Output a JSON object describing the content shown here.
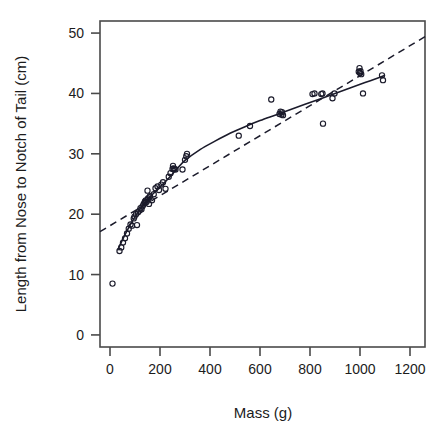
{
  "chart_data": {
    "type": "scatter",
    "title": "",
    "xlabel": "Mass (g)",
    "ylabel": "Length from Nose to Notch of Tail (cm)",
    "xlim": [
      -40,
      1260
    ],
    "ylim": [
      -2,
      52
    ],
    "xticks": [
      0,
      200,
      400,
      600,
      800,
      1000,
      1200
    ],
    "yticks": [
      0,
      10,
      20,
      30,
      40,
      50
    ],
    "xtick_labels": [
      "0",
      "200",
      "400",
      "600",
      "800",
      "1000",
      "1200"
    ],
    "ytick_labels": [
      "0",
      "10",
      "20",
      "30",
      "40",
      "50"
    ],
    "grid": false,
    "legend": "none",
    "marker": "open-circle",
    "point_color": "#1b1b2b",
    "series": [
      {
        "name": "Observations",
        "points": [
          [
            10,
            8.5
          ],
          [
            38,
            13.9
          ],
          [
            45,
            14.5
          ],
          [
            52,
            15.3
          ],
          [
            60,
            16.0
          ],
          [
            68,
            16.8
          ],
          [
            75,
            17.6
          ],
          [
            82,
            18.3
          ],
          [
            88,
            18.1
          ],
          [
            95,
            19.3
          ],
          [
            98,
            19.6
          ],
          [
            104,
            20.0
          ],
          [
            108,
            18.2
          ],
          [
            112,
            20.3
          ],
          [
            118,
            20.6
          ],
          [
            122,
            21.0
          ],
          [
            126,
            20.8
          ],
          [
            130,
            21.3
          ],
          [
            134,
            21.6
          ],
          [
            138,
            21.9
          ],
          [
            140,
            22.1
          ],
          [
            143,
            22.3
          ],
          [
            146,
            22.0
          ],
          [
            150,
            22.4
          ],
          [
            152,
            22.6
          ],
          [
            156,
            21.7
          ],
          [
            158,
            22.8
          ],
          [
            160,
            23.0
          ],
          [
            150,
            23.9
          ],
          [
            168,
            22.3
          ],
          [
            175,
            23.3
          ],
          [
            182,
            24.3
          ],
          [
            190,
            24.6
          ],
          [
            196,
            24.0
          ],
          [
            205,
            24.9
          ],
          [
            212,
            25.3
          ],
          [
            222,
            24.2
          ],
          [
            235,
            26.2
          ],
          [
            242,
            26.8
          ],
          [
            250,
            27.5
          ],
          [
            252,
            28.0
          ],
          [
            254,
            27.6
          ],
          [
            258,
            27.5
          ],
          [
            262,
            27.4
          ],
          [
            290,
            27.4
          ],
          [
            300,
            29.0
          ],
          [
            305,
            29.6
          ],
          [
            308,
            30.0
          ],
          [
            515,
            33.0
          ],
          [
            560,
            34.6
          ],
          [
            645,
            39.0
          ],
          [
            678,
            36.6
          ],
          [
            682,
            37.0
          ],
          [
            686,
            36.5
          ],
          [
            688,
            36.9
          ],
          [
            692,
            36.4
          ],
          [
            810,
            39.9
          ],
          [
            818,
            40.0
          ],
          [
            845,
            39.9
          ],
          [
            850,
            40.0
          ],
          [
            852,
            35.0
          ],
          [
            890,
            39.2
          ],
          [
            898,
            40.0
          ],
          [
            995,
            43.6
          ],
          [
            998,
            44.2
          ],
          [
            1000,
            43.4
          ],
          [
            1002,
            43.7
          ],
          [
            1005,
            43.2
          ],
          [
            1012,
            40.0
          ],
          [
            1088,
            43.0
          ],
          [
            1092,
            42.2
          ]
        ]
      }
    ],
    "fit_curve": {
      "name": "Fitted curve",
      "style": "solid",
      "points": [
        [
          30,
          14.0
        ],
        [
          60,
          16.6
        ],
        [
          90,
          18.9
        ],
        [
          120,
          20.8
        ],
        [
          150,
          22.4
        ],
        [
          180,
          23.7
        ],
        [
          210,
          24.9
        ],
        [
          240,
          26.2
        ],
        [
          270,
          27.6
        ],
        [
          300,
          28.9
        ],
        [
          360,
          30.7
        ],
        [
          420,
          32.1
        ],
        [
          480,
          33.4
        ],
        [
          540,
          34.5
        ],
        [
          600,
          35.5
        ],
        [
          660,
          36.4
        ],
        [
          720,
          37.3
        ],
        [
          780,
          38.2
        ],
        [
          840,
          39.1
        ],
        [
          900,
          40.0
        ],
        [
          960,
          40.9
        ],
        [
          1020,
          41.8
        ],
        [
          1080,
          42.7
        ],
        [
          1100,
          43.0
        ]
      ]
    },
    "reference_line": {
      "name": "Reference line",
      "style": "dashed",
      "points": [
        [
          -40,
          17.1
        ],
        [
          1260,
          49.4
        ]
      ]
    }
  }
}
